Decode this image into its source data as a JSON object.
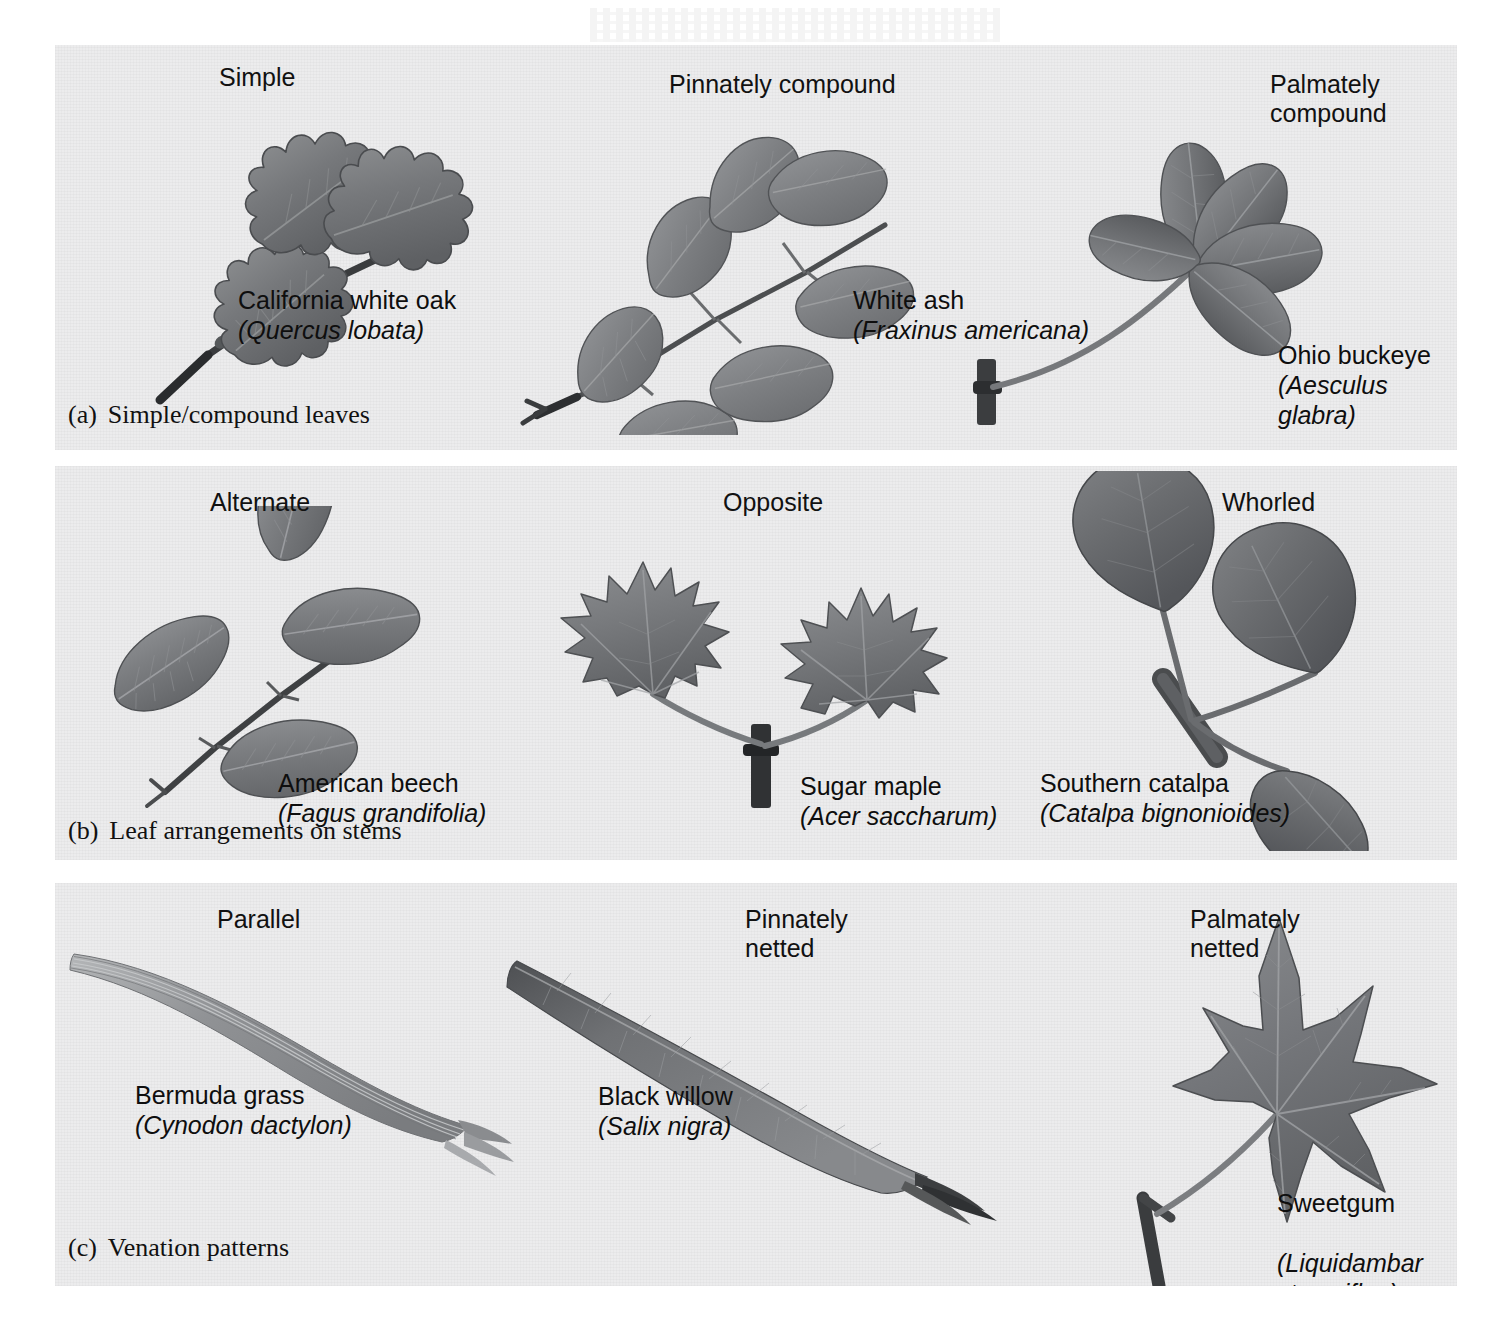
{
  "figure": {
    "background_color": "#ffffff",
    "panel_background_color": "#ececed",
    "ink_color": "#111111"
  },
  "panels": [
    {
      "id": "a",
      "tag": "(a)",
      "caption": "Simple/compound leaves",
      "specimens": [
        {
          "category": "Simple",
          "common_name": "California white oak",
          "scientific_name": "(Quercus lobata)",
          "leaf_type": "lobed-oak-leaves-on-twig"
        },
        {
          "category": "Pinnately compound",
          "common_name": "White ash",
          "scientific_name": "(Fraxinus americana)",
          "leaf_type": "pinnate-compound-seven-leaflets"
        },
        {
          "category": "Palmately\ncompound",
          "common_name": "Ohio buckeye",
          "scientific_name": "(Aesculus glabra)",
          "leaf_type": "palmate-compound-five-leaflets"
        }
      ]
    },
    {
      "id": "b",
      "tag": "(b)",
      "caption": "Leaf arrangements on stems",
      "specimens": [
        {
          "category": "Alternate",
          "common_name": "American beech",
          "scientific_name": "(Fagus grandifolia)",
          "leaf_type": "alternate-ovate-leaves-on-twig"
        },
        {
          "category": "Opposite",
          "common_name": "Sugar maple",
          "scientific_name": "(Acer saccharum)",
          "leaf_type": "opposite-maple-leaf-pair"
        },
        {
          "category": "Whorled",
          "common_name": "Southern catalpa",
          "scientific_name": "(Catalpa bignonioides)",
          "leaf_type": "whorled-three-heart-shaped-leaves"
        }
      ]
    },
    {
      "id": "c",
      "tag": "(c)",
      "caption": "Venation patterns",
      "specimens": [
        {
          "category": "Parallel",
          "common_name": "Bermuda grass",
          "scientific_name": "(Cynodon dactylon)",
          "leaf_type": "long-narrow-grass-blade"
        },
        {
          "category": "Pinnately\nnetted",
          "common_name": "Black willow",
          "scientific_name": "(Salix nigra)",
          "leaf_type": "lanceolate-willow-leaf"
        },
        {
          "category": "Palmately\nnetted",
          "common_name": "Sweetgum",
          "scientific_name": "(Liquidambar\nstyraciflua)",
          "leaf_type": "five-lobed-star-leaf"
        }
      ]
    }
  ]
}
